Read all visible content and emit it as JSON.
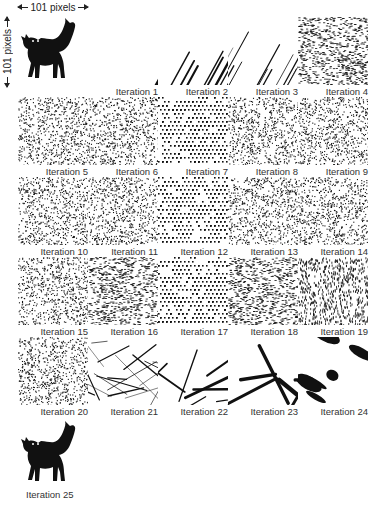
{
  "figure": {
    "width_label": "101 pixels",
    "height_label": "101 pixels",
    "colors": {
      "ink": "#111111",
      "background": "#ffffff"
    }
  },
  "panels": [
    {
      "id": 0,
      "label": "",
      "kind": "cat",
      "col": 0,
      "row": 0
    },
    {
      "id": 1,
      "label": "Iteration 1",
      "kind": "streaks-thick",
      "col": 1,
      "row": 0
    },
    {
      "id": 2,
      "label": "Iteration 2",
      "kind": "streaks-medium",
      "col": 2,
      "row": 0
    },
    {
      "id": 3,
      "label": "Iteration 3",
      "kind": "streaks-fine",
      "col": 3,
      "row": 0
    },
    {
      "id": 4,
      "label": "Iteration 4",
      "kind": "noise-diagonal",
      "col": 4,
      "row": 0
    },
    {
      "id": 5,
      "label": "Iteration 5",
      "kind": "noise",
      "col": 0,
      "row": 1
    },
    {
      "id": 6,
      "label": "Iteration 6",
      "kind": "noise",
      "col": 1,
      "row": 1
    },
    {
      "id": 7,
      "label": "Iteration 7",
      "kind": "noise-lattice",
      "col": 2,
      "row": 1
    },
    {
      "id": 8,
      "label": "Iteration 8",
      "kind": "noise",
      "col": 3,
      "row": 1
    },
    {
      "id": 9,
      "label": "Iteration 9",
      "kind": "noise",
      "col": 4,
      "row": 1
    },
    {
      "id": 10,
      "label": "Iteration 10",
      "kind": "noise",
      "col": 0,
      "row": 2
    },
    {
      "id": 11,
      "label": "Iteration 11",
      "kind": "noise",
      "col": 1,
      "row": 2
    },
    {
      "id": 12,
      "label": "Iteration 12",
      "kind": "noise-lattice",
      "col": 2,
      "row": 2
    },
    {
      "id": 13,
      "label": "Iteration 13",
      "kind": "noise",
      "col": 3,
      "row": 2
    },
    {
      "id": 14,
      "label": "Iteration 14",
      "kind": "noise",
      "col": 4,
      "row": 2
    },
    {
      "id": 15,
      "label": "Iteration 15",
      "kind": "noise",
      "col": 0,
      "row": 3
    },
    {
      "id": 16,
      "label": "Iteration 16",
      "kind": "noise-diagonal",
      "col": 1,
      "row": 3
    },
    {
      "id": 17,
      "label": "Iteration 17",
      "kind": "noise-lattice",
      "col": 2,
      "row": 3
    },
    {
      "id": 18,
      "label": "Iteration 18",
      "kind": "noise-diagonal",
      "col": 3,
      "row": 3
    },
    {
      "id": 19,
      "label": "Iteration 19",
      "kind": "noise-vertical",
      "col": 4,
      "row": 3
    },
    {
      "id": 20,
      "label": "Iteration 20",
      "kind": "noise",
      "col": 0,
      "row": 4
    },
    {
      "id": 21,
      "label": "Iteration 21",
      "kind": "streaks-fine-low",
      "col": 1,
      "row": 4
    },
    {
      "id": 22,
      "label": "Iteration 22",
      "kind": "streaks-medium-low",
      "col": 2,
      "row": 4
    },
    {
      "id": 23,
      "label": "Iteration 23",
      "kind": "streaks-thick-low",
      "col": 3,
      "row": 4
    },
    {
      "id": 24,
      "label": "Iteration 24",
      "kind": "blobs",
      "col": 4,
      "row": 4
    },
    {
      "id": 25,
      "label": "Iteration 25",
      "kind": "cat",
      "col": 0,
      "row": 5
    }
  ]
}
